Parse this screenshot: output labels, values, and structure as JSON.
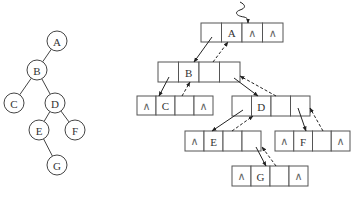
{
  "tree": {
    "nodes": [
      {
        "id": "A",
        "label": "A",
        "x": 57,
        "y": 41
      },
      {
        "id": "B",
        "label": "B",
        "x": 37,
        "y": 70
      },
      {
        "id": "C",
        "label": "C",
        "x": 14,
        "y": 103
      },
      {
        "id": "D",
        "label": "D",
        "x": 55,
        "y": 103
      },
      {
        "id": "E",
        "label": "E",
        "x": 39,
        "y": 130
      },
      {
        "id": "F",
        "label": "F",
        "x": 75,
        "y": 130
      },
      {
        "id": "G",
        "label": "G",
        "x": 57,
        "y": 165
      }
    ],
    "edges": [
      [
        "A",
        "B"
      ],
      [
        "B",
        "C"
      ],
      [
        "B",
        "D"
      ],
      [
        "D",
        "E"
      ],
      [
        "D",
        "F"
      ],
      [
        "E",
        "G"
      ]
    ],
    "radius": 10
  },
  "linked": {
    "null_symbol": "∧",
    "nodes": [
      {
        "id": "A",
        "x": 201,
        "y": 23,
        "w": 82,
        "h": 19,
        "cells": [
          "",
          "A",
          "∧",
          "∧"
        ]
      },
      {
        "id": "B",
        "x": 158,
        "y": 62,
        "w": 82,
        "h": 20,
        "cells": [
          "",
          "B",
          "",
          ""
        ]
      },
      {
        "id": "C",
        "x": 137,
        "y": 96,
        "w": 76,
        "h": 19,
        "cells": [
          "∧",
          "C",
          "",
          "∧"
        ]
      },
      {
        "id": "D",
        "x": 232,
        "y": 96,
        "w": 78,
        "h": 20,
        "cells": [
          "",
          "D",
          "",
          ""
        ]
      },
      {
        "id": "E",
        "x": 185,
        "y": 131,
        "w": 76,
        "h": 20,
        "cells": [
          "∧",
          "E",
          "",
          ""
        ]
      },
      {
        "id": "F",
        "x": 275,
        "y": 131,
        "w": 75,
        "h": 20,
        "cells": [
          "∧",
          "F",
          "",
          "∧"
        ]
      },
      {
        "id": "G",
        "x": 232,
        "y": 166,
        "w": 76,
        "h": 20,
        "cells": [
          "∧",
          "G",
          "",
          "∧"
        ]
      }
    ],
    "root_pointer": {
      "style": "squiggle",
      "target": "A"
    }
  }
}
